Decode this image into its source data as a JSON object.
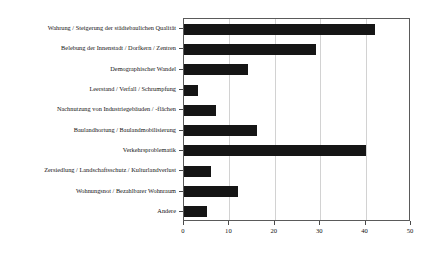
{
  "chart_data": {
    "type": "bar",
    "orientation": "horizontal",
    "title": "",
    "xlabel": "",
    "ylabel": "",
    "xlim": [
      0,
      50
    ],
    "xticks": [
      0,
      10,
      20,
      30,
      40,
      50
    ],
    "xtick_labels": [
      "0",
      "10",
      "20",
      "30",
      "40",
      "50"
    ],
    "grid": "vertical",
    "legend": "none",
    "bar_color": "#151515",
    "categories": [
      "Wahrung / Steigerung der städtebaulichen Qualität",
      "Belebung der Innenstadt / Dorfkern / Zentren",
      "Demographischer Wandel",
      "Leerstand / Verfall / Schrumpfung",
      "Nachnutzung von Industriegebäuden / -flächen",
      "Baulandhortung / Baulandmobilisierung",
      "Verkehrsproblematik",
      "Zersiedlung / Landschaftsschutz / Kulturlandverlust",
      "Wohnungsnot / Bezahlbarer Wohnraum",
      "Andere"
    ],
    "values": [
      42,
      29,
      14,
      3,
      7,
      16,
      40,
      6,
      12,
      5
    ]
  }
}
